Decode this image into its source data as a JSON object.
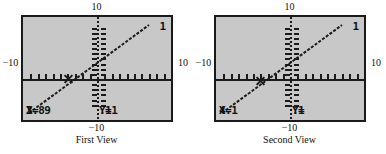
{
  "figure": {
    "panels": [
      {
        "caption": "First View",
        "graph_number": "1",
        "axis_labels": {
          "top": "10",
          "bottom": "−10",
          "left": "−10",
          "right": "10"
        },
        "readout": {
          "x_label": "X=",
          "x_negative": true,
          "x_value": "3.89",
          "y_label": "Y=",
          "y_negative": false,
          "y_value": ".11"
        },
        "trace_point": {
          "x": -3.89,
          "y": 0.11
        }
      },
      {
        "caption": "Second View",
        "graph_number": "1",
        "axis_labels": {
          "top": "10",
          "bottom": "−10",
          "left": "−10",
          "right": "10"
        },
        "readout": {
          "x_label": "X=",
          "x_negative": true,
          "x_value": "4.1",
          "y_label": "Y=",
          "y_negative": true,
          "y_value": ".1"
        },
        "trace_point": {
          "x": -4.1,
          "y": -0.1
        }
      }
    ]
  },
  "chart_data": {
    "type": "line",
    "title": "",
    "xlabel": "",
    "ylabel": "",
    "xlim": [
      -10,
      10
    ],
    "ylim": [
      -10,
      10
    ],
    "grid": false,
    "legend": "none",
    "x_tick_labels": [
      "−10",
      "10"
    ],
    "y_tick_labels": [
      "−10",
      "10"
    ],
    "tick_spacing": 1,
    "series": [
      {
        "name": "graph 1",
        "description": "straight line with positive slope crossing the x-axis near x = -4",
        "x": [
          -10,
          -4,
          0,
          7
        ],
        "y": [
          -6.1,
          0,
          4.1,
          11.2
        ],
        "slope": 1.0,
        "intercept": 4.0
      }
    ],
    "annotations": [
      {
        "panel": "First View",
        "type": "trace-cursor",
        "x": -3.89,
        "y": 0.11
      },
      {
        "panel": "Second View",
        "type": "trace-cursor",
        "x": -4.1,
        "y": -0.1
      }
    ]
  },
  "colors": {
    "screen_background": "#c8c8c8",
    "ink": "#1a1a1a",
    "page_background": "#ffffff"
  }
}
